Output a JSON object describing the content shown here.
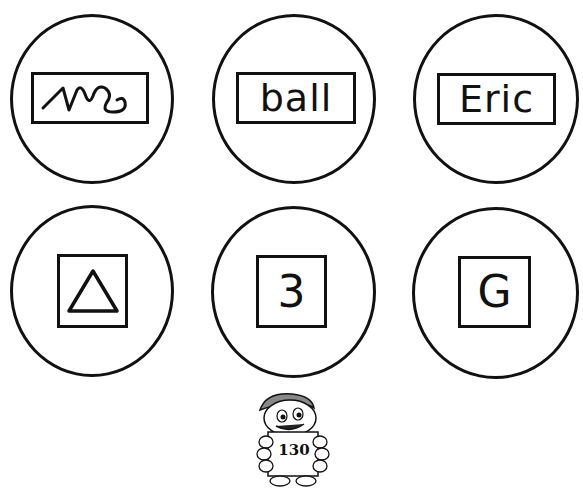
{
  "cards": [
    {
      "id": "scribble",
      "kind": "word-box",
      "label": "",
      "icon": "scribble-icon"
    },
    {
      "id": "ball",
      "kind": "word-box",
      "label": "ball"
    },
    {
      "id": "eric",
      "kind": "word-box",
      "label": "Eric"
    },
    {
      "id": "triangle",
      "kind": "square-box",
      "label": "",
      "icon": "triangle-icon"
    },
    {
      "id": "three",
      "kind": "square-box",
      "label": "3"
    },
    {
      "id": "g",
      "kind": "square-box",
      "label": "G"
    }
  ],
  "footer": {
    "page_number": "130",
    "mascot": "mascot-holding-sign"
  }
}
